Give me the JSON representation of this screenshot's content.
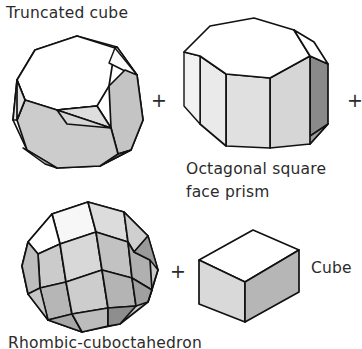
{
  "figure": {
    "kind": "polyhedral-dissection-equation",
    "background_color": "#ffffff",
    "ink_color": "#111111",
    "text_color": "#2b2b2b"
  },
  "labels": {
    "truncated_cube": "Truncated cube",
    "octagonal_prism_line1": "Octagonal square",
    "octagonal_prism_line2": "face prism",
    "cube": "Cube",
    "rhombicuboctahedron": "Rhombic-cuboctahedron"
  },
  "operators": {
    "plus_1": "+",
    "plus_2": "+",
    "plus_3": "+"
  },
  "shading": {
    "white": "#ffffff",
    "very_light": "#ededed",
    "light": "#dedede",
    "light_mid": "#d2d2d2",
    "mid": "#c4c4c4",
    "mid_dark": "#b2b2b2",
    "dark": "#9a9a9a",
    "darkest": "#7d7d7d"
  },
  "shapes": {
    "truncated_cube": {
      "name": "Truncated cube",
      "position": {
        "x": 5,
        "y": 28,
        "width": 145,
        "height": 145
      }
    },
    "octagonal_prism": {
      "name": "Octagonal square face prism",
      "position": {
        "x": 182,
        "y": 16,
        "width": 155,
        "height": 145
      }
    },
    "rhombicuboctahedron": {
      "name": "Rhombic-cuboctahedron",
      "position": {
        "x": 12,
        "y": 198,
        "width": 152,
        "height": 135
      }
    },
    "cube": {
      "name": "Cube",
      "position": {
        "x": 197,
        "y": 228,
        "width": 108,
        "height": 92
      }
    }
  }
}
